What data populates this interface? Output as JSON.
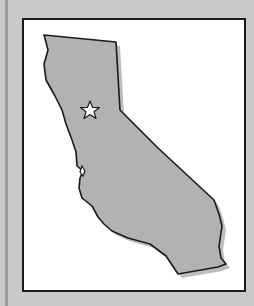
{
  "map": {
    "region": "California",
    "marker": {
      "type": "star",
      "meaning": "state capital",
      "x": 90,
      "y": 110
    },
    "colors": {
      "background": "#c9c9c9",
      "frame_fill": "#ffffff",
      "frame_stroke": "#1a1a1a",
      "land_fill": "#b2b2b2",
      "land_shadow": "#bdbdbd",
      "outline": "#1a1a1a",
      "star_fill": "#ffffff"
    }
  }
}
